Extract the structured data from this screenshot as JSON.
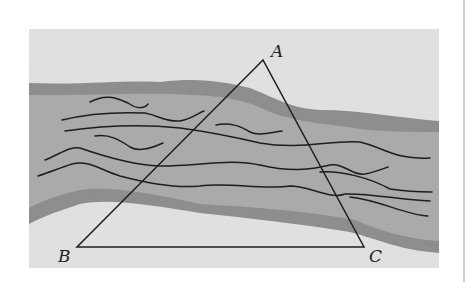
{
  "diagram": {
    "labels": {
      "a": "A",
      "b": "B",
      "c": "C"
    },
    "vertices": {
      "A": [
        263,
        60
      ],
      "B": [
        77,
        247
      ],
      "C": [
        364,
        247
      ]
    },
    "colors": {
      "background": "#ffffff",
      "land": "#e2e2e2",
      "river": "#a9a9a9",
      "bank": "#8b8b8b",
      "lines": "#1e1e1e",
      "divider": "#cfcfcf"
    }
  }
}
